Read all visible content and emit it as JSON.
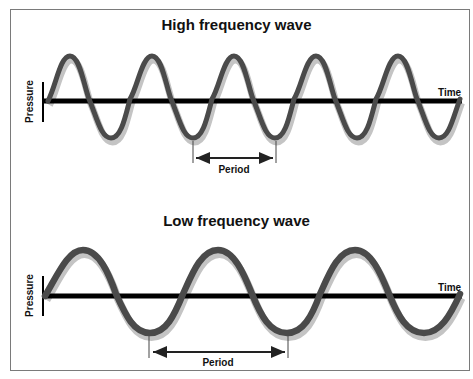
{
  "panels": [
    {
      "title": "High frequency wave",
      "y_axis_label": "Pressure",
      "x_axis_label": "Time",
      "period_label": "Period",
      "cycles_shown": 5,
      "period_px": 82
    },
    {
      "title": "Low frequency wave",
      "y_axis_label": "Pressure",
      "x_axis_label": "Time",
      "period_label": "Period",
      "cycles_shown": 3,
      "period_px": 137
    }
  ],
  "colors": {
    "wave": "#4a4a4a",
    "wave_shadow": "#b8b8b8",
    "axis": "#000000",
    "frame": "#7a7a7a"
  }
}
